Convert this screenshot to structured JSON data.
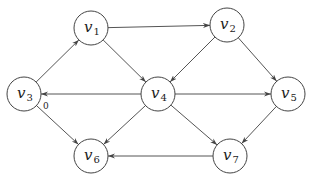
{
  "graph": {
    "title": "",
    "directed": true,
    "nodes": [
      {
        "id": "v1",
        "name": "v",
        "sub": "1",
        "x": 91,
        "y": 28
      },
      {
        "id": "v2",
        "name": "v",
        "sub": "2",
        "x": 227,
        "y": 25
      },
      {
        "id": "v3",
        "name": "v",
        "sub": "3",
        "x": 24,
        "y": 94
      },
      {
        "id": "v4",
        "name": "v",
        "sub": "4",
        "x": 158,
        "y": 94
      },
      {
        "id": "v5",
        "name": "v",
        "sub": "5",
        "x": 288,
        "y": 94
      },
      {
        "id": "v6",
        "name": "v",
        "sub": "6",
        "x": 91,
        "y": 156
      },
      {
        "id": "v7",
        "name": "v",
        "sub": "7",
        "x": 230,
        "y": 156
      }
    ],
    "edges": [
      {
        "from": "v1",
        "to": "v2"
      },
      {
        "from": "v1",
        "to": "v4"
      },
      {
        "from": "v2",
        "to": "v4"
      },
      {
        "from": "v2",
        "to": "v5"
      },
      {
        "from": "v3",
        "to": "v1"
      },
      {
        "from": "v3",
        "to": "v6"
      },
      {
        "from": "v4",
        "to": "v3"
      },
      {
        "from": "v4",
        "to": "v5"
      },
      {
        "from": "v4",
        "to": "v6"
      },
      {
        "from": "v4",
        "to": "v7"
      },
      {
        "from": "v5",
        "to": "v7"
      },
      {
        "from": "v7",
        "to": "v6"
      }
    ],
    "annotations": [
      {
        "text": "0",
        "x": 43,
        "y": 109
      }
    ],
    "node_radius": 17
  }
}
